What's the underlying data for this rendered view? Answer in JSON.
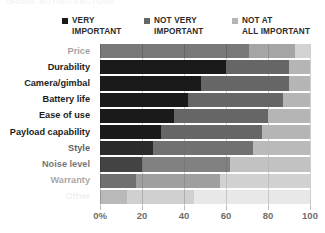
{
  "title": {
    "text": "DRONE BUYING FACTORS"
  },
  "legend": {
    "position": "top",
    "items": [
      {
        "label": "VERY\nIMPORTANT",
        "color": "#1a1a1a",
        "name": "very-important"
      },
      {
        "label": "NOT VERY\nIMPORTANT",
        "color": "#666666",
        "name": "not-very-important"
      },
      {
        "label": "NOT AT\nALL IMPORTANT",
        "color": "#b5b5b5",
        "name": "not-at-all-important"
      }
    ]
  },
  "axis": {
    "x_ticks": [
      "0%",
      "20",
      "40",
      "60",
      "80",
      "100"
    ],
    "x_values": [
      0,
      20,
      40,
      60,
      80,
      100
    ]
  },
  "chart_data": {
    "type": "bar",
    "orientation": "horizontal",
    "stacked": true,
    "stack_mode": "percent",
    "title": "DRONE BUYING FACTORS",
    "xlabel": "",
    "ylabel": "",
    "xlim": [
      0,
      100
    ],
    "grid": true,
    "legend_position": "top",
    "categories": [
      "Price",
      "Durability",
      "Camera/gimbal",
      "Battery life",
      "Ease of use",
      "Payload capability",
      "Style",
      "Noise level",
      "Warranty",
      "Other"
    ],
    "series": [
      {
        "name": "VERY IMPORTANT",
        "color": "#1a1a1a",
        "values": [
          71,
          60,
          48,
          42,
          35,
          29,
          25,
          20,
          17,
          13
        ]
      },
      {
        "name": "NOT VERY IMPORTANT",
        "color": "#666666",
        "values": [
          22,
          30,
          42,
          45,
          45,
          48,
          48,
          42,
          40,
          32
        ]
      },
      {
        "name": "NOT AT ALL IMPORTANT",
        "color": "#b5b5b5",
        "values": [
          7,
          10,
          10,
          13,
          20,
          23,
          27,
          38,
          43,
          55
        ]
      }
    ]
  }
}
